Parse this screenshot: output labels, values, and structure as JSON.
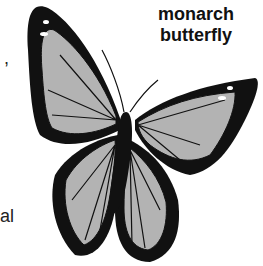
{
  "caption": {
    "line1": "monarch",
    "line2": "butterfly"
  },
  "fragments": {
    "comma": ",",
    "al": "al"
  },
  "colors": {
    "wing_fill": "#b3b3b3",
    "outline": "#111111"
  },
  "illustration": {
    "subject": "butterfly-illustration"
  }
}
